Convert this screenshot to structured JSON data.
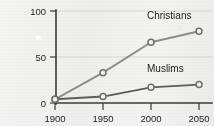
{
  "chart_data": {
    "type": "line",
    "title": "",
    "subtitle": "",
    "xlabel": "",
    "ylabel": "",
    "x": [
      1900,
      1950,
      2000,
      2050
    ],
    "xtick_labels": [
      "1900",
      "1950",
      "2000",
      "2050"
    ],
    "ytick_labels": [
      "0",
      "50",
      "100"
    ],
    "yticks": [
      0,
      50,
      100
    ],
    "ylim": [
      0,
      100
    ],
    "xlim": [
      1900,
      2050
    ],
    "grid": "horizontal",
    "legend_position": "inline-annotation",
    "series": [
      {
        "name": "Christians",
        "label": "Christians",
        "color": "#8d8d8b",
        "values": [
          4,
          33,
          66,
          78
        ]
      },
      {
        "name": "Muslims",
        "label": "Muslims",
        "color": "#5c5c5a",
        "values": [
          4,
          7,
          17,
          20
        ]
      }
    ],
    "annotations": [
      {
        "text": "Christians",
        "x": 2000,
        "y": 88
      },
      {
        "text": "Muslims",
        "x": 2000,
        "y": 40
      }
    ]
  },
  "axes": {
    "y_ticks": [
      {
        "label": "100",
        "value": 100
      },
      {
        "label": "50",
        "value": 50
      },
      {
        "label": "0",
        "value": 0
      }
    ],
    "x_ticks": [
      {
        "label": "1900",
        "value": 1900
      },
      {
        "label": "1950",
        "value": 1950
      },
      {
        "label": "2000",
        "value": 2000
      },
      {
        "label": "2050",
        "value": 2050
      }
    ]
  },
  "labels": {
    "christians": "Christians",
    "muslims": "Muslims"
  },
  "colors": {
    "background": "#f2f2f0",
    "axis": "#3a3a3a",
    "grid": "#cfcfcd",
    "christians_line": "#8d8d8b",
    "muslims_line": "#5c5c5a",
    "marker_fill": "#f3f3f1",
    "marker_stroke": "#6f6f6d",
    "text": "#242424"
  }
}
